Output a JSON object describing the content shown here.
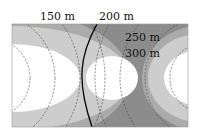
{
  "diagram": {
    "labels": {
      "l150": "150 m",
      "l200": "200 m",
      "l250": "250 m",
      "l300": "300 m"
    },
    "colors": {
      "white": "#ffffff",
      "light": "#cdcdcd",
      "mid": "#ababab",
      "dark": "#8c8c8c",
      "dash": "#444444",
      "curve": "#000000"
    }
  }
}
